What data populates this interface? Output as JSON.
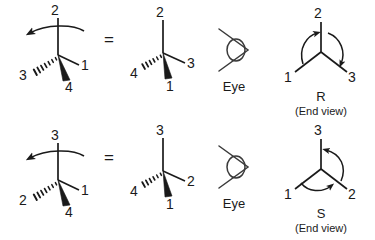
{
  "figure": {
    "type": "chemistry-stereochemistry-diagram",
    "stroke_color": "#1a1a1a",
    "background_color": "#ffffff"
  },
  "rows": [
    {
      "id": "row-r",
      "result_label": "R",
      "result_sublabel": "(End view)",
      "equals_sign": "=",
      "eye_label": "Eye",
      "rotation_direction": "clockwise",
      "source_structure": {
        "name": "wedge-dash-structure-r-source",
        "curved_arrow": "counterclockwise-top-arc",
        "substituents": [
          {
            "label": "2",
            "bond": "plain",
            "position": "up"
          },
          {
            "label": "3",
            "bond": "dashed",
            "position": "lower-left"
          },
          {
            "label": "1",
            "bond": "plain",
            "position": "right"
          },
          {
            "label": "4",
            "bond": "wedge",
            "position": "down"
          }
        ]
      },
      "rotated_structure": {
        "name": "wedge-dash-structure-r-rotated",
        "substituents": [
          {
            "label": "2",
            "bond": "plain",
            "position": "up"
          },
          {
            "label": "4",
            "bond": "dashed",
            "position": "left"
          },
          {
            "label": "3",
            "bond": "plain",
            "position": "right"
          },
          {
            "label": "1",
            "bond": "wedge",
            "position": "down"
          }
        ]
      },
      "end_view": {
        "name": "end-view-r",
        "substituents": [
          {
            "label": "2",
            "position": "up"
          },
          {
            "label": "1",
            "position": "lower-left"
          },
          {
            "label": "3",
            "position": "lower-right"
          }
        ],
        "arrow_sequence": "1 to 2 to 3"
      }
    },
    {
      "id": "row-s",
      "result_label": "S",
      "result_sublabel": "(End view)",
      "equals_sign": "=",
      "eye_label": "Eye",
      "rotation_direction": "counterclockwise",
      "source_structure": {
        "name": "wedge-dash-structure-s-source",
        "curved_arrow": "counterclockwise-top-arc",
        "substituents": [
          {
            "label": "3",
            "bond": "plain",
            "position": "up"
          },
          {
            "label": "2",
            "bond": "dashed",
            "position": "lower-left"
          },
          {
            "label": "1",
            "bond": "plain",
            "position": "right"
          },
          {
            "label": "4",
            "bond": "wedge",
            "position": "down"
          }
        ]
      },
      "rotated_structure": {
        "name": "wedge-dash-structure-s-rotated",
        "substituents": [
          {
            "label": "3",
            "bond": "plain",
            "position": "up"
          },
          {
            "label": "4",
            "bond": "dashed",
            "position": "left"
          },
          {
            "label": "2",
            "bond": "plain",
            "position": "right"
          },
          {
            "label": "1",
            "bond": "wedge",
            "position": "down"
          }
        ]
      },
      "end_view": {
        "name": "end-view-s",
        "substituents": [
          {
            "label": "3",
            "position": "up"
          },
          {
            "label": "1",
            "position": "lower-left"
          },
          {
            "label": "2",
            "position": "lower-right"
          }
        ],
        "arrow_sequence": "1 to 3 to 2"
      }
    }
  ]
}
